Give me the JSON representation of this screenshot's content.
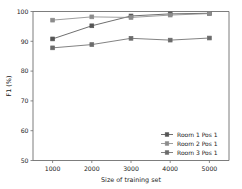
{
  "chart_data": {
    "type": "line",
    "title": "",
    "xlabel": "Size of training set",
    "ylabel": "F1 (%)",
    "x": [
      1000,
      2000,
      3000,
      4000,
      5000
    ],
    "xticklabels": [
      "1000",
      "2000",
      "3000",
      "4000",
      "5000"
    ],
    "yticks": [
      50,
      60,
      70,
      80,
      90,
      100
    ],
    "yticklabels": [
      "50",
      "60",
      "70",
      "80",
      "90",
      "100"
    ],
    "xlim": [
      500,
      5500
    ],
    "ylim": [
      50,
      100
    ],
    "grid": false,
    "legend_position": "lower right",
    "series": [
      {
        "name": "Room 1 Pos 1",
        "values": [
          90.8,
          95.2,
          98.5,
          99.2,
          99.4
        ],
        "color": "#555555",
        "marker": "square"
      },
      {
        "name": "Room 2 Pos 1",
        "values": [
          97.1,
          98.2,
          98.0,
          98.8,
          99.3
        ],
        "color": "#8c8c8c",
        "marker": "square"
      },
      {
        "name": "Room 3 Pos 1",
        "values": [
          87.8,
          88.9,
          91.0,
          90.4,
          91.1
        ],
        "color": "#6b6b6b",
        "marker": "square"
      }
    ]
  },
  "axes": {
    "x_axis_title": "Size of training set",
    "y_axis_title": "F1 (%)",
    "x_tick_0": "1000",
    "x_tick_1": "2000",
    "x_tick_2": "3000",
    "x_tick_3": "4000",
    "x_tick_4": "5000",
    "y_tick_0": "100",
    "y_tick_1": "90",
    "y_tick_2": "80",
    "y_tick_3": "70",
    "y_tick_4": "60",
    "y_tick_5": "50"
  },
  "legend": {
    "entry_0": "Room 1 Pos 1",
    "entry_1": "Room 2 Pos 1",
    "entry_2": "Room 3 Pos 1"
  }
}
